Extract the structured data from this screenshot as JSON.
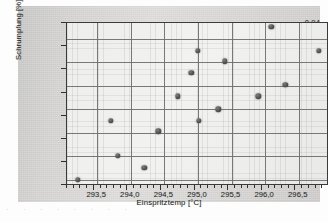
{
  "chart_data": {
    "type": "scatter",
    "title": "",
    "xlabel": "Einspritztemp [°C]",
    "ylabel": "Schrumpfung [%]",
    "xlim": [
      293.05,
      296.95
    ],
    "ylim": [
      0.8145,
      0.9535
    ],
    "grid": true,
    "legend": false,
    "xticks": [
      293.5,
      294.0,
      294.5,
      295.0,
      295.5,
      296.0,
      296.5
    ],
    "xticklabels": [
      "293,5",
      "294,0",
      "294,5",
      "295,0",
      "295,5",
      "296,0",
      "296,5"
    ],
    "yticks": [
      0.82,
      0.84,
      0.86,
      0.88,
      0.9,
      0.92,
      0.94
    ],
    "yticklabels": [
      "0,82",
      "0,84",
      "0,86",
      "0,88",
      "0,90",
      "0,92",
      "0,94"
    ],
    "marker": "filled-circle",
    "marker_color": "#4a4a4a",
    "points": [
      {
        "x": 293.21,
        "y": 0.82
      },
      {
        "x": 293.7,
        "y": 0.87
      },
      {
        "x": 293.81,
        "y": 0.84
      },
      {
        "x": 294.2,
        "y": 0.83
      },
      {
        "x": 294.41,
        "y": 0.861
      },
      {
        "x": 294.7,
        "y": 0.891
      },
      {
        "x": 294.9,
        "y": 0.911
      },
      {
        "x": 295.0,
        "y": 0.93
      },
      {
        "x": 295.01,
        "y": 0.87
      },
      {
        "x": 295.3,
        "y": 0.88
      },
      {
        "x": 295.4,
        "y": 0.921
      },
      {
        "x": 295.9,
        "y": 0.891
      },
      {
        "x": 296.09,
        "y": 0.95
      },
      {
        "x": 296.3,
        "y": 0.901
      },
      {
        "x": 296.8,
        "y": 0.93
      }
    ]
  },
  "figure": {
    "background_color": "#d8d7d5",
    "plot_background_color": "#eeeeec",
    "frame_color": "#3a3a3a",
    "gridline_color": "#6e6e6e"
  },
  "page_bleed": {
    "text": "·   ·     ·        ·      ·    ·   ·    ·"
  }
}
